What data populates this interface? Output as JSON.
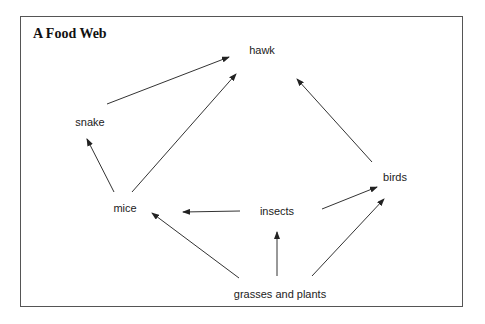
{
  "title": "A Food Web",
  "nodes": {
    "hawk": {
      "label": "hawk",
      "x": 262,
      "y": 50
    },
    "snake": {
      "label": "snake",
      "x": 90,
      "y": 122
    },
    "mice": {
      "label": "mice",
      "x": 125,
      "y": 208
    },
    "insects": {
      "label": "insects",
      "x": 277,
      "y": 211
    },
    "birds": {
      "label": "birds",
      "x": 395,
      "y": 177
    },
    "grasses": {
      "label": "grasses and plants",
      "x": 280,
      "y": 294
    }
  },
  "edges": [
    {
      "from": "snake",
      "to": "hawk",
      "x1": 107,
      "y1": 104,
      "x2": 229,
      "y2": 57
    },
    {
      "from": "mice",
      "to": "hawk",
      "x1": 132,
      "y1": 192,
      "x2": 236,
      "y2": 74
    },
    {
      "from": "mice",
      "to": "snake",
      "x1": 114,
      "y1": 192,
      "x2": 87,
      "y2": 139
    },
    {
      "from": "birds",
      "to": "hawk",
      "x1": 372,
      "y1": 162,
      "x2": 297,
      "y2": 79
    },
    {
      "from": "insects",
      "to": "birds",
      "x1": 322,
      "y1": 209,
      "x2": 377,
      "y2": 187
    },
    {
      "from": "insects",
      "to": "mice",
      "x1": 240,
      "y1": 211,
      "x2": 183,
      "y2": 212
    },
    {
      "from": "grasses",
      "to": "mice",
      "x1": 239,
      "y1": 278,
      "x2": 152,
      "y2": 213
    },
    {
      "from": "grasses",
      "to": "insects",
      "x1": 277,
      "y1": 276,
      "x2": 277,
      "y2": 232
    },
    {
      "from": "grasses",
      "to": "birds",
      "x1": 312,
      "y1": 276,
      "x2": 384,
      "y2": 199
    }
  ],
  "colors": {
    "line": "#333333",
    "text": "#222222",
    "border": "#555555"
  }
}
